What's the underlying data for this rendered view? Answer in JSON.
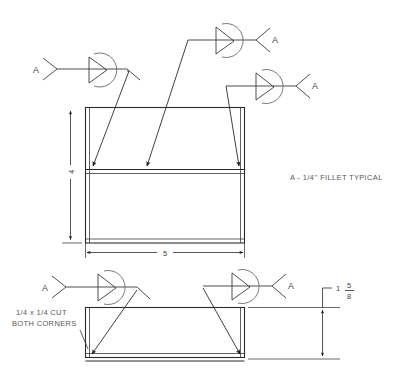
{
  "drawing": {
    "title": "Welding Detail Drawing",
    "notes": [
      {
        "id": "fillet-note",
        "text": "A - 1/4'' FILLET TYPICAL"
      },
      {
        "id": "cut-note-line1",
        "text": "1/4 x 1/4 CUT"
      },
      {
        "id": "cut-note-line2",
        "text": "BOTH CORNERS"
      }
    ],
    "dimensions": [
      {
        "id": "height-dim",
        "value": "4",
        "orientation": "vertical"
      },
      {
        "id": "width-dim",
        "value": "5",
        "orientation": "horizontal"
      },
      {
        "id": "thickness-dim",
        "whole": "1",
        "numerator": "5",
        "denominator": "8",
        "orientation": "vertical"
      }
    ],
    "weld_symbols": [
      {
        "id": "weld-symbol-upper-left",
        "tail_label": "A",
        "type": "fillet",
        "all_around": true
      },
      {
        "id": "weld-symbol-upper-center",
        "tail_label": "A",
        "type": "fillet",
        "all_around": true
      },
      {
        "id": "weld-symbol-upper-right",
        "tail_label": "A",
        "type": "fillet",
        "all_around": true
      },
      {
        "id": "weld-symbol-lower-left",
        "tail_label": "A",
        "type": "fillet",
        "all_around": true
      },
      {
        "id": "weld-symbol-lower-right",
        "tail_label": "A",
        "type": "fillet",
        "all_around": true
      }
    ],
    "views": [
      {
        "id": "front-view",
        "shape": "rectangle-with-internal-flange"
      },
      {
        "id": "side-view",
        "shape": "rectangle-with-corner-cuts"
      }
    ],
    "colors": {
      "line": "#2b2b2b",
      "symbol": "#3a3a3a",
      "arc": "#6a6a6a",
      "text": "#4a4a4a",
      "background": "#ffffff"
    }
  }
}
